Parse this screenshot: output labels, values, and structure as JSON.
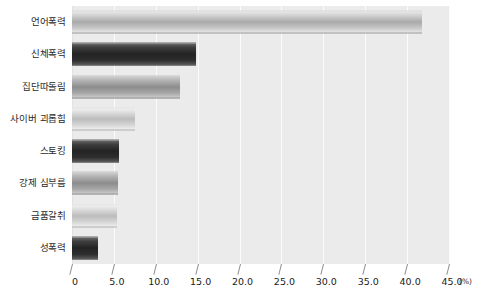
{
  "chart_data": {
    "type": "bar",
    "orientation": "horizontal",
    "title": "",
    "xlabel": "(%)",
    "ylabel": "",
    "categories": [
      "언어폭력",
      "신체폭력",
      "집단따돌림",
      "사이버 괴롭힘",
      "스토킹",
      "강제 심부름",
      "금품갈취",
      "성폭력"
    ],
    "values": [
      41.8,
      14.8,
      12.9,
      7.5,
      5.6,
      5.5,
      5.4,
      3.1
    ],
    "xlim": [
      0,
      45.0
    ],
    "xticks": [
      0,
      5.0,
      10.0,
      15.0,
      20.0,
      25.0,
      30.0,
      35.0,
      40.0,
      45.0
    ],
    "xtick_labels": [
      "0",
      "5.0",
      "10.0",
      "15.0",
      "20.0",
      "25.0",
      "30.0",
      "35.0",
      "40.0",
      "45.0"
    ],
    "unit": "(%)",
    "grid": true,
    "legend": false,
    "bar_styles": [
      "light",
      "dark",
      "mid",
      "pale",
      "dark",
      "mid",
      "pale",
      "dark"
    ],
    "colors": {
      "plot_background": "#ebebeb",
      "gridline": "#fbfbfb",
      "bar_light": "#a9a9a9",
      "bar_dark": "#232323",
      "bar_mid": "#8c8c8c",
      "bar_pale": "#bcbcbc",
      "text": "#1c1c1c",
      "page_background": "#ffffff"
    }
  }
}
